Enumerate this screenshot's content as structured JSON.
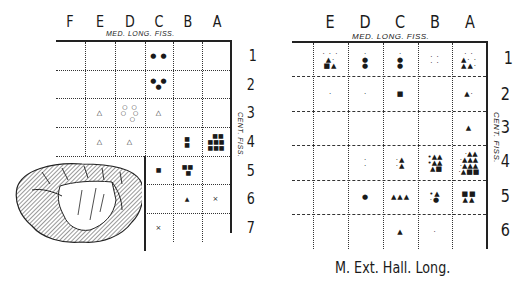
{
  "left_chart": {
    "columns": [
      "F",
      "E",
      "D",
      "C",
      "B",
      "A"
    ],
    "rows": [
      "1",
      "2",
      "3",
      "4",
      "5",
      "6",
      "7"
    ],
    "top_label": "MED. LONG. FISS.",
    "side_label": "CENT. FISS.",
    "cells": {
      "C1": "● ●",
      "C2": "● ●\n●",
      "E3": "△",
      "D3": "○ ○\n○  ○\n  ○",
      "C3": "△",
      "E4": "△",
      "D4": "△",
      "B4": "■\n■",
      "A4": "  ■■\n■■■\n■■■",
      "C5": "■",
      "B5": "■■\n ■",
      "B6": "▲",
      "A6": "×",
      "C7": "×"
    }
  },
  "right_chart": {
    "columns": [
      "E",
      "D",
      "C",
      "B",
      "A"
    ],
    "rows": [
      "1",
      "2",
      "3",
      "4",
      "5",
      "6"
    ],
    "top_label": "MED. LONG. FISS.",
    "side_label": "CENT. FISS.",
    "caption": "M. Ext. Hall. Long.",
    "cells": {
      "E1": "· · ·\n▲·\n■▲",
      "D1": "·\n●\n●",
      "C1": "·\n●\n●",
      "B1": "· ·\n· ·",
      "A1": "· ·\n▲· ·\n▲▲·",
      "E2": "·",
      "D2": "·",
      "C2": "■",
      "A2": "▲·",
      "A3": "▲",
      "D4": "·\n·",
      "C4": "·▲\n·▲",
      "B4": "•▲▲\n•▲▲\n ▲■",
      "A4": "  ·▲▲\n·▲▲▲\n·▲▲▲\n·▲■■",
      "D5": "●",
      "C5": "▲▲▲",
      "B5": "•▲\n·●",
      "A5": "■■\n▲▲",
      "C6": "▲",
      "B6": "·"
    }
  }
}
